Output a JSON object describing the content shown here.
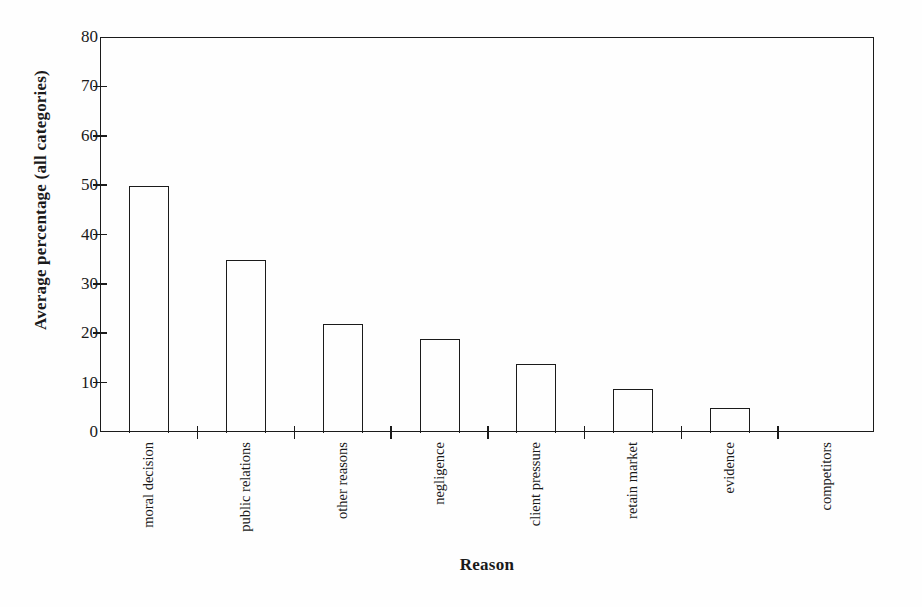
{
  "chart_data": {
    "type": "bar",
    "title": "",
    "xlabel": "Reason",
    "ylabel": "Average percentage (all categories)",
    "categories": [
      "moral decision",
      "public relations",
      "other reasons",
      "negligence",
      "client pressure",
      "retain market",
      "evidence",
      "competitors"
    ],
    "values": [
      50,
      35,
      22,
      19,
      14,
      9,
      5,
      0
    ],
    "ylim": [
      0,
      80
    ],
    "yticks": [
      0,
      10,
      20,
      30,
      40,
      50,
      60,
      70,
      80
    ],
    "ytick_labels": [
      "0",
      "10",
      "20",
      "30",
      "40",
      "50",
      "60",
      "70",
      "80"
    ],
    "grid": false,
    "legend": null,
    "bar_style": {
      "fill": "#ffffff",
      "edge_color": "#1b1b1b"
    },
    "axis_color": "#1b1b1b",
    "background": "#fefefe"
  }
}
